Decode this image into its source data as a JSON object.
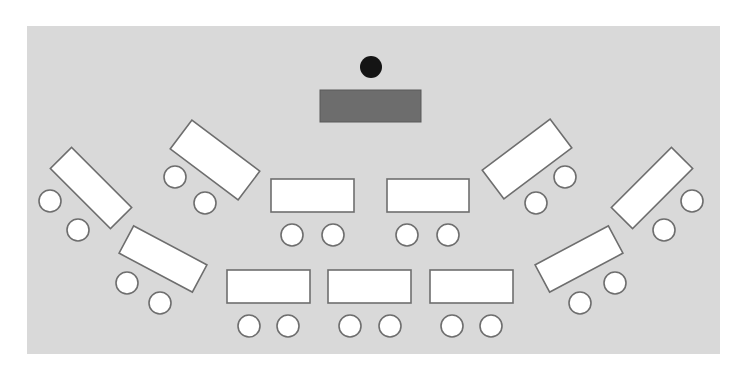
{
  "diagram": {
    "type": "classroom-seating-layout",
    "colors": {
      "floor": "#d9d9d9",
      "table_fill": "#ffffff",
      "outline": "#6e6e6e",
      "front_desk": "#6d6d6d",
      "instructor": "#141414",
      "background": "#ffffff"
    },
    "floor": {
      "x": 27,
      "y": 26,
      "width": 693,
      "height": 328
    },
    "front": {
      "instructor": {
        "cx": 371,
        "cy": 67,
        "r": 11
      },
      "desk": {
        "x": 320,
        "y": 90,
        "width": 101,
        "height": 32
      }
    },
    "tables": [
      {
        "id": "far-left",
        "cx": 91,
        "cy": 188,
        "width": 85,
        "height": 30,
        "angle": 45
      },
      {
        "id": "left-upper",
        "cx": 215,
        "cy": 160,
        "width": 85,
        "height": 36,
        "angle": 37
      },
      {
        "id": "left-lower",
        "cx": 163,
        "cy": 259,
        "width": 83,
        "height": 31,
        "angle": 28
      },
      {
        "id": "center-left",
        "cx": 312.5,
        "cy": 195.5,
        "width": 83,
        "height": 33,
        "angle": 0
      },
      {
        "id": "center-right",
        "cx": 428,
        "cy": 195.5,
        "width": 82,
        "height": 33,
        "angle": 0
      },
      {
        "id": "bottom-left",
        "cx": 268.5,
        "cy": 286.5,
        "width": 83,
        "height": 33,
        "angle": 0
      },
      {
        "id": "bottom-center",
        "cx": 369.5,
        "cy": 286.5,
        "width": 83,
        "height": 33,
        "angle": 0
      },
      {
        "id": "bottom-right",
        "cx": 471.5,
        "cy": 286.5,
        "width": 83,
        "height": 33,
        "angle": 0
      },
      {
        "id": "right-upper",
        "cx": 527,
        "cy": 159,
        "width": 85,
        "height": 36,
        "angle": -37
      },
      {
        "id": "far-right",
        "cx": 652,
        "cy": 188,
        "width": 85,
        "height": 30,
        "angle": -45
      },
      {
        "id": "right-lower",
        "cx": 579,
        "cy": 259,
        "width": 83,
        "height": 31,
        "angle": -28
      }
    ],
    "chairs": [
      {
        "table": "far-left",
        "cx": 50,
        "cy": 201,
        "r": 11
      },
      {
        "table": "far-left",
        "cx": 78,
        "cy": 230,
        "r": 11
      },
      {
        "table": "left-upper",
        "cx": 175,
        "cy": 177,
        "r": 11
      },
      {
        "table": "left-upper",
        "cx": 205,
        "cy": 203,
        "r": 11
      },
      {
        "table": "left-lower",
        "cx": 127,
        "cy": 283,
        "r": 11
      },
      {
        "table": "left-lower",
        "cx": 160,
        "cy": 303,
        "r": 11
      },
      {
        "table": "center-left",
        "cx": 292,
        "cy": 235,
        "r": 11
      },
      {
        "table": "center-left",
        "cx": 333,
        "cy": 235,
        "r": 11
      },
      {
        "table": "center-right",
        "cx": 407,
        "cy": 235,
        "r": 11
      },
      {
        "table": "center-right",
        "cx": 448,
        "cy": 235,
        "r": 11
      },
      {
        "table": "bottom-left",
        "cx": 249,
        "cy": 326,
        "r": 11
      },
      {
        "table": "bottom-left",
        "cx": 288,
        "cy": 326,
        "r": 11
      },
      {
        "table": "bottom-center",
        "cx": 350,
        "cy": 326,
        "r": 11
      },
      {
        "table": "bottom-center",
        "cx": 390,
        "cy": 326,
        "r": 11
      },
      {
        "table": "bottom-right",
        "cx": 452,
        "cy": 326,
        "r": 11
      },
      {
        "table": "bottom-right",
        "cx": 491,
        "cy": 326,
        "r": 11
      },
      {
        "table": "right-upper",
        "cx": 565,
        "cy": 177,
        "r": 11
      },
      {
        "table": "right-upper",
        "cx": 536,
        "cy": 203,
        "r": 11
      },
      {
        "table": "far-right",
        "cx": 692,
        "cy": 201,
        "r": 11
      },
      {
        "table": "far-right",
        "cx": 664,
        "cy": 230,
        "r": 11
      },
      {
        "table": "right-lower",
        "cx": 615,
        "cy": 283,
        "r": 11
      },
      {
        "table": "right-lower",
        "cx": 580,
        "cy": 303,
        "r": 11
      }
    ],
    "counts": {
      "tables": 11,
      "chairs": 22
    }
  }
}
